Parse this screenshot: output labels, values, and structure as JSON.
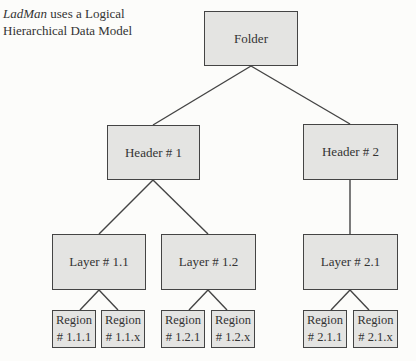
{
  "caption": {
    "brand": "LadMan",
    "line1_rest": " uses a Logical",
    "line2": "Hierarchical Data Model"
  },
  "nodes": {
    "folder": "Folder",
    "header1": "Header # 1",
    "header2": "Header # 2",
    "layer11": "Layer # 1.1",
    "layer12": "Layer # 1.2",
    "layer21": "Layer # 2.1",
    "region111": {
      "line1": "Region",
      "line2": "# 1.1.1"
    },
    "region11x": {
      "line1": "Region",
      "line2": "# 1.1.x"
    },
    "region121": {
      "line1": "Region",
      "line2": "# 1.2.1"
    },
    "region12x": {
      "line1": "Region",
      "line2": "# 1.2.x"
    },
    "region211": {
      "line1": "Region",
      "line2": "# 2.1.1"
    },
    "region21x": {
      "line1": "Region",
      "line2": "# 2.1.x"
    }
  },
  "edges": [
    [
      "Folder",
      "Header # 1"
    ],
    [
      "Folder",
      "Header # 2"
    ],
    [
      "Header # 1",
      "Layer # 1.1"
    ],
    [
      "Header # 1",
      "Layer # 1.2"
    ],
    [
      "Header # 2",
      "Layer # 2.1"
    ],
    [
      "Layer # 1.1",
      "Region # 1.1.1"
    ],
    [
      "Layer # 1.1",
      "Region # 1.1.x"
    ],
    [
      "Layer # 1.2",
      "Region # 1.2.1"
    ],
    [
      "Layer # 1.2",
      "Region # 1.2.x"
    ],
    [
      "Layer # 2.1",
      "Region # 2.1.1"
    ],
    [
      "Layer # 2.1",
      "Region # 2.1.x"
    ]
  ],
  "colors": {
    "box_fill": "#e4e4e2",
    "line": "#444444"
  }
}
